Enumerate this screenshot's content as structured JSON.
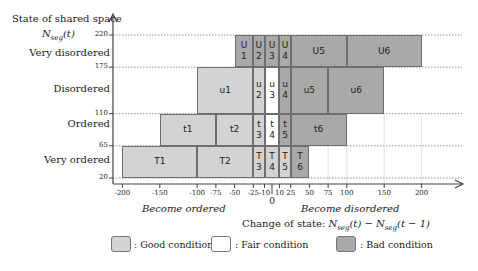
{
  "yaxis": {
    "title": "State of shared space",
    "var_label": "N_seg(t)",
    "ticks": [
      220,
      175,
      110,
      65,
      20
    ],
    "categories": [
      "Very disordered",
      "Disordered",
      "Ordered",
      "Very ordered"
    ]
  },
  "xaxis": {
    "title": "Change of state: N_seg(t) − N_seg(t − 1)",
    "ticks": [
      "-200",
      "-150",
      "-100",
      "-75",
      "-50",
      "-25",
      "-10",
      "0",
      "10",
      "25",
      "50",
      "75",
      "100",
      "150",
      "200"
    ],
    "left_note": "Become ordered",
    "right_note": "Become disordered"
  },
  "legend": [
    {
      "label": ": Good condition",
      "condition": "good"
    },
    {
      "label": ": Fair condition",
      "condition": "fair"
    },
    {
      "label": ": Bad condition",
      "condition": "bad"
    }
  ],
  "colors": {
    "good": "#d3d3d3",
    "fair": "#ffffff",
    "bad": "#a9a9a9",
    "border": "#6e6e6e"
  },
  "cells": [
    {
      "id": "U1",
      "text": "U\n1",
      "x0": -50,
      "x1": -25,
      "y0": 175,
      "y1": 220,
      "condition": "bad"
    },
    {
      "id": "U2",
      "text": "U\n2",
      "x0": -25,
      "x1": -10,
      "y0": 175,
      "y1": 220,
      "condition": "bad"
    },
    {
      "id": "U3",
      "text": "U\n3",
      "x0": -10,
      "x1": 10,
      "y0": 175,
      "y1": 220,
      "condition": "bad"
    },
    {
      "id": "U4",
      "text": "U\n4",
      "x0": 10,
      "x1": 25,
      "y0": 175,
      "y1": 220,
      "condition": "bad"
    },
    {
      "id": "U5",
      "text": "U5",
      "x0": 25,
      "x1": 100,
      "y0": 175,
      "y1": 220,
      "condition": "bad"
    },
    {
      "id": "U6",
      "text": "U6",
      "x0": 100,
      "x1": 200,
      "y0": 175,
      "y1": 220,
      "condition": "bad"
    },
    {
      "id": "u1",
      "text": "u1",
      "x0": -100,
      "x1": -25,
      "y0": 110,
      "y1": 175,
      "condition": "good"
    },
    {
      "id": "u2",
      "text": "u\n2",
      "x0": -25,
      "x1": -10,
      "y0": 110,
      "y1": 175,
      "condition": "good"
    },
    {
      "id": "u3",
      "text": "u\n3",
      "x0": -10,
      "x1": 10,
      "y0": 110,
      "y1": 175,
      "condition": "fair"
    },
    {
      "id": "u4",
      "text": "u\n4",
      "x0": 10,
      "x1": 25,
      "y0": 110,
      "y1": 175,
      "condition": "bad"
    },
    {
      "id": "u5",
      "text": "u5",
      "x0": 25,
      "x1": 75,
      "y0": 110,
      "y1": 175,
      "condition": "bad"
    },
    {
      "id": "u6",
      "text": "u6",
      "x0": 75,
      "x1": 150,
      "y0": 110,
      "y1": 175,
      "condition": "bad"
    },
    {
      "id": "t1",
      "text": "t1",
      "x0": -150,
      "x1": -75,
      "y0": 65,
      "y1": 110,
      "condition": "good"
    },
    {
      "id": "t2",
      "text": "t2",
      "x0": -75,
      "x1": -25,
      "y0": 65,
      "y1": 110,
      "condition": "good"
    },
    {
      "id": "t3",
      "text": "t\n3",
      "x0": -25,
      "x1": -10,
      "y0": 65,
      "y1": 110,
      "condition": "good"
    },
    {
      "id": "t4",
      "text": "t\n4",
      "x0": -10,
      "x1": 10,
      "y0": 65,
      "y1": 110,
      "condition": "fair"
    },
    {
      "id": "t5",
      "text": "t\n5",
      "x0": 10,
      "x1": 25,
      "y0": 65,
      "y1": 110,
      "condition": "bad"
    },
    {
      "id": "t6",
      "text": "t6",
      "x0": 25,
      "x1": 100,
      "y0": 65,
      "y1": 110,
      "condition": "bad"
    },
    {
      "id": "T1",
      "text": "T1",
      "x0": -200,
      "x1": -100,
      "y0": 20,
      "y1": 65,
      "condition": "good"
    },
    {
      "id": "T2",
      "text": "T2",
      "x0": -100,
      "x1": -25,
      "y0": 20,
      "y1": 65,
      "condition": "good"
    },
    {
      "id": "T3",
      "text": "T\n3",
      "x0": -25,
      "x1": -10,
      "y0": 20,
      "y1": 65,
      "condition": "good"
    },
    {
      "id": "T4",
      "text": "T\n4",
      "x0": -10,
      "x1": 10,
      "y0": 20,
      "y1": 65,
      "condition": "good"
    },
    {
      "id": "T5",
      "text": "T\n5",
      "x0": 10,
      "x1": 25,
      "y0": 20,
      "y1": 65,
      "condition": "good"
    },
    {
      "id": "T6",
      "text": "T\n6",
      "x0": 25,
      "x1": 50,
      "y0": 20,
      "y1": 65,
      "condition": "bad"
    }
  ]
}
